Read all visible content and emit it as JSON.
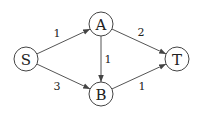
{
  "diagram": {
    "type": "directed-weighted-graph",
    "nodes": [
      {
        "id": "S",
        "label": "S",
        "x": 26,
        "y": 59
      },
      {
        "id": "A",
        "label": "A",
        "x": 101,
        "y": 24
      },
      {
        "id": "B",
        "label": "B",
        "x": 101,
        "y": 94
      },
      {
        "id": "T",
        "label": "T",
        "x": 177,
        "y": 59
      }
    ],
    "edges": [
      {
        "from": "S",
        "to": "A",
        "weight": "1",
        "lx": 57,
        "ly": 33
      },
      {
        "from": "S",
        "to": "B",
        "weight": "3",
        "lx": 57,
        "ly": 86
      },
      {
        "from": "A",
        "to": "B",
        "weight": "1",
        "lx": 108,
        "ly": 59
      },
      {
        "from": "A",
        "to": "T",
        "weight": "2",
        "lx": 141,
        "ly": 32
      },
      {
        "from": "B",
        "to": "T",
        "weight": "1",
        "lx": 142,
        "ly": 86
      }
    ]
  }
}
